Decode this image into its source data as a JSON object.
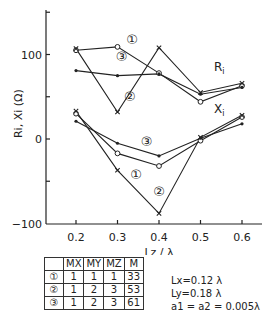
{
  "chart_data": {
    "type": "line",
    "title": "",
    "xlabel": "Lz / λ",
    "ylabel": "Ri, Xi (Ω)",
    "x": [
      0.2,
      0.3,
      0.4,
      0.5,
      0.6
    ],
    "xticks": [
      "0.2",
      "0.3",
      "0.4",
      "0.5",
      "0.6"
    ],
    "yticks": [
      "100",
      "0",
      "-100"
    ],
    "ylim": [
      -100,
      150
    ],
    "xlim": [
      0.13,
      0.65
    ],
    "grid": false,
    "series": [
      {
        "name": "R1",
        "case": "1",
        "marker": "o",
        "values": [
          105,
          109,
          78,
          44,
          63
        ]
      },
      {
        "name": "R2",
        "case": "2",
        "marker": "x",
        "values": [
          107,
          32,
          108,
          55,
          66
        ]
      },
      {
        "name": "R3",
        "case": "3",
        "marker": "dot",
        "values": [
          81,
          75,
          77,
          53,
          61
        ]
      },
      {
        "name": "X1",
        "case": "1",
        "marker": "o",
        "values": [
          30,
          -17,
          -32,
          -2,
          26
        ]
      },
      {
        "name": "X2",
        "case": "2",
        "marker": "x",
        "values": [
          33,
          -37,
          -88,
          2,
          28
        ]
      },
      {
        "name": "X3",
        "case": "3",
        "marker": "dot",
        "values": [
          21,
          -5,
          -20,
          1,
          18
        ]
      }
    ],
    "annotations": [
      {
        "text": "①",
        "x": 0.335,
        "y": 113
      },
      {
        "text": "③",
        "x": 0.31,
        "y": 92
      },
      {
        "text": "②",
        "x": 0.33,
        "y": 45
      },
      {
        "text": "Ri",
        "x": 0.545,
        "y": 80
      },
      {
        "text": "Xi",
        "x": 0.545,
        "y": 31
      },
      {
        "text": "③",
        "x": 0.37,
        "y": -8
      },
      {
        "text": "①",
        "x": 0.345,
        "y": -47
      },
      {
        "text": "②",
        "x": 0.4,
        "y": -68
      }
    ]
  },
  "table": {
    "headers": [
      "",
      "MX",
      "MY",
      "MZ",
      "M"
    ],
    "rows": [
      [
        "①",
        "1",
        "1",
        "1",
        "33"
      ],
      [
        "②",
        "1",
        "2",
        "3",
        "53"
      ],
      [
        "③",
        "1",
        "2",
        "3",
        "61"
      ]
    ]
  },
  "params": [
    "Lx=0.12 λ",
    "Ly=0.18 λ",
    "a1 = a2 = 0.005λ"
  ]
}
